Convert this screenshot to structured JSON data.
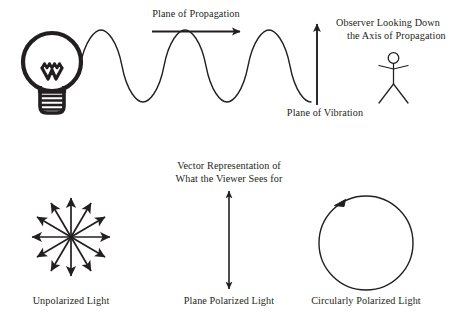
{
  "figure": {
    "title_implied": "Polarization of Light Diagram",
    "background_color": "#ffffff",
    "stroke_color": "#231f20",
    "width": 461,
    "height": 320
  },
  "top_panel": {
    "light_source": {
      "icon_name": "light-bulb-icon",
      "description": "Incandescent light bulb with filament and screw base"
    },
    "wave": {
      "icon_name": "sine-wave-icon",
      "cycles": 4,
      "description": "Sinusoidal light wave emitted from bulb"
    },
    "propagation_arrow": {
      "icon_name": "right-arrow-icon",
      "label": "Plane of Propagation",
      "direction": "right"
    },
    "vibration_arrow": {
      "icon_name": "up-arrow-icon",
      "label": "Plane of Vibration",
      "direction": "up"
    },
    "observer": {
      "icon_name": "stick-figure-observer-icon",
      "label_line1": "Observer Looking Down",
      "label_line2": "the Axis of Propagation"
    }
  },
  "bottom_panel": {
    "caption_line1": "Vector Representation of",
    "caption_line2": "What the Viewer Sees for",
    "items": [
      {
        "id": "unpolarized",
        "label": "Unpolarized Light",
        "icon_name": "radial-arrow-star-icon",
        "arrow_count": 12,
        "angle_step_degrees": 30
      },
      {
        "id": "plane-polarized",
        "label": "Plane Polarized Light",
        "icon_name": "double-headed-vertical-arrow-icon"
      },
      {
        "id": "circularly-polarized",
        "label": "Circularly Polarized Light",
        "icon_name": "counter-clockwise-circle-arrow-icon"
      }
    ]
  }
}
